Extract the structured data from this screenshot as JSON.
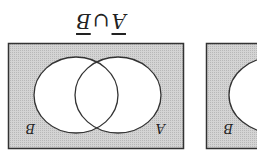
{
  "figure": {
    "title": {
      "left_set": "A",
      "operator": "∪",
      "right_set": "B",
      "complemented": true,
      "orientation": "rotated 180°"
    },
    "panels": [
      {
        "labels": {
          "bottom_left": "B",
          "bottom_right": "A"
        },
        "shaded_region": "outside both circles"
      },
      {
        "labels": {
          "bottom_left": "B"
        },
        "shaded_region": "outside circle (partially visible)"
      }
    ],
    "colors": {
      "shade": "#c9c9c9",
      "line": "#333333",
      "background": "#ffffff"
    }
  }
}
